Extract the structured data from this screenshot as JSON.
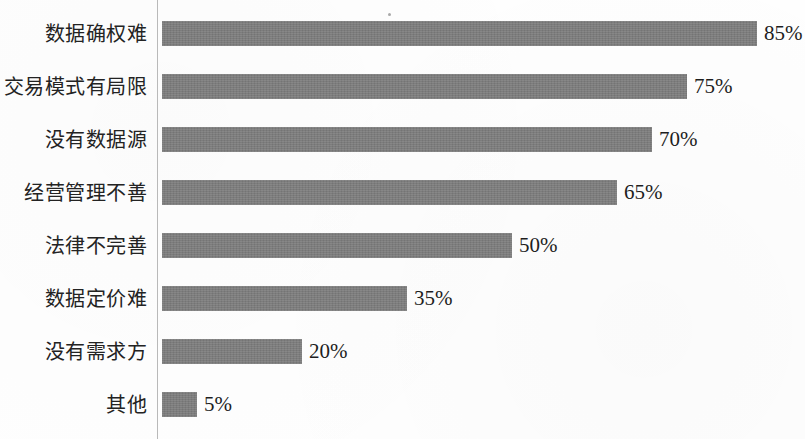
{
  "chart_data": {
    "type": "bar",
    "orientation": "horizontal",
    "title": "",
    "subtitle": "",
    "xlabel": "",
    "ylabel": "",
    "xlim": [
      0,
      90
    ],
    "grid": false,
    "legend": null,
    "bar_color": "#7c7c7c",
    "axis_color": "#b9b9b9",
    "label_color": "#232323",
    "value_suffix": "%",
    "categories": [
      "数据确权难",
      "交易模式有局限",
      "没有数据源",
      "经营管理不善",
      "法律不完善",
      "数据定价难",
      "没有需求方",
      "其他"
    ],
    "values": [
      85,
      75,
      70,
      65,
      50,
      35,
      20,
      5
    ],
    "value_labels": [
      "85%",
      "75%",
      "70%",
      "65%",
      "50%",
      "35%",
      "20%",
      "5%"
    ]
  }
}
